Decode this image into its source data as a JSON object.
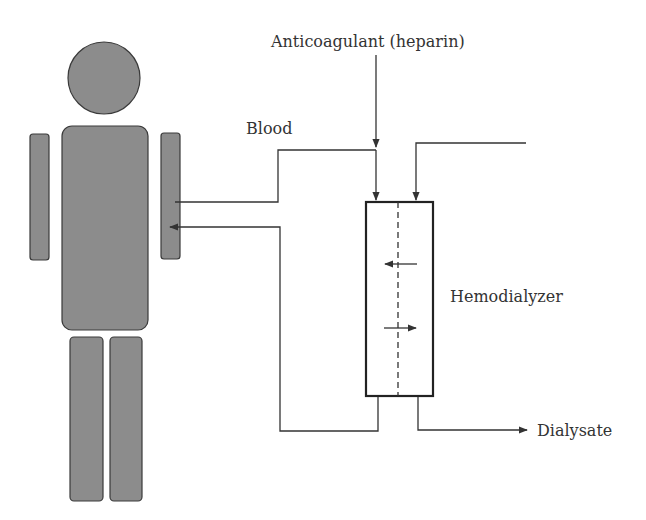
{
  "diagram": {
    "labels": {
      "anticoagulant": "Anticoagulant (heparin)",
      "blood": "Blood",
      "hemodialyzer": "Hemodialyzer",
      "dialysate": "Dialysate"
    },
    "nodes": [
      {
        "id": "patient",
        "label": "Patient (human figure)"
      },
      {
        "id": "hemodialyzer",
        "label": "Hemodialyzer"
      },
      {
        "id": "anticoagulant",
        "label": "Anticoagulant (heparin)"
      },
      {
        "id": "dialysate",
        "label": "Dialysate"
      }
    ],
    "edges": [
      {
        "from": "patient",
        "to": "hemodialyzer",
        "label": "Blood"
      },
      {
        "from": "anticoagulant",
        "to": "hemodialyzer-blood-line"
      },
      {
        "from": "dialysate-in",
        "to": "hemodialyzer"
      },
      {
        "from": "hemodialyzer",
        "to": "patient",
        "label": "blood return"
      },
      {
        "from": "hemodialyzer",
        "to": "dialysate",
        "label": "Dialysate out"
      }
    ],
    "colors": {
      "figure_fill": "#8c8c8c",
      "figure_stroke": "#3a3a3a",
      "line": "#333333",
      "text": "#333333"
    }
  }
}
